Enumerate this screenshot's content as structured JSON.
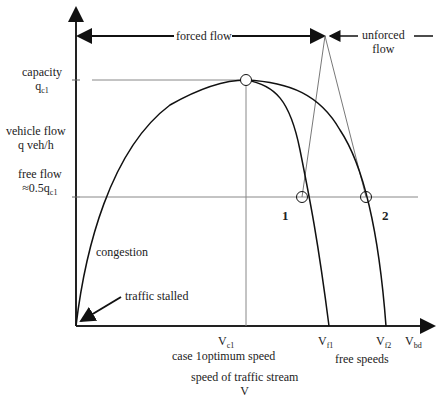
{
  "diagram": {
    "top_arrows": {
      "forced_flow": "forced flow",
      "unforced_flow_line1": "unforced",
      "unforced_flow_line2": "flow"
    },
    "y_labels": {
      "capacity": "capacity",
      "capacity_symbol": "q",
      "capacity_sub": "c1",
      "vehicle_flow": "vehicle flow",
      "vehicle_flow_unit": "q veh/h",
      "free_flow": "free flow",
      "free_flow_value": "≈0.5q",
      "free_flow_sub": "c1"
    },
    "annotations": {
      "congestion": "congestion",
      "traffic_stalled": "traffic stalled",
      "case1": "1",
      "case2": "2"
    },
    "x_labels": {
      "vc1": "V",
      "vc1_sub": "c1",
      "optimum_speed": "case 1optimum speed",
      "vf1": "V",
      "vf1_sub": "f1",
      "vf2": "V",
      "vf2_sub": "f2",
      "vbd": "V",
      "vbd_sub": "bd",
      "free_speeds": "free speeds",
      "axis_title": "speed of traffic stream",
      "axis_symbol": "V"
    }
  }
}
